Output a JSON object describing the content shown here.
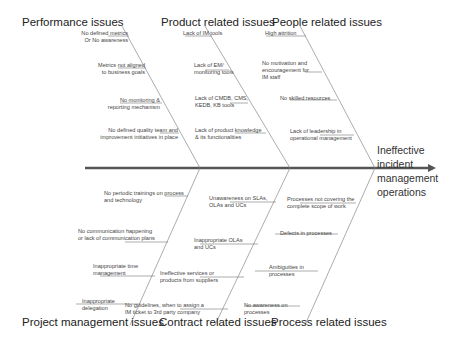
{
  "diagram": {
    "type": "fishbone",
    "effect": "Ineffective incident management operations",
    "effect_lines": [
      "Ineffective",
      "incident",
      "management",
      "operations"
    ],
    "categories": {
      "performance": {
        "title": "Performance issues",
        "causes": [
          "No defined metrics Or No awareness",
          "Metrics not aligned to business goals",
          "No monitoring & reporting mechanism",
          "No defined quality team and improvement initiatives in place"
        ]
      },
      "product": {
        "title": "Product related issues",
        "causes": [
          "Lack of IM tools",
          "Lack of EM/ monitoring tools",
          "Lack of CMDB, CMS, KEDB, KB tools",
          "Lack of product knowledge & its functionalities"
        ]
      },
      "people": {
        "title": "People related issues",
        "causes": [
          "High attrition",
          "No motivation and encouragement for IM staff",
          "No skilled resources",
          "Lack of leadership in operational management"
        ]
      },
      "project": {
        "title": "Project management issues",
        "causes": [
          "No periodic trainings on process and technology",
          "No communication happening or lack of communication plans",
          "Inappropriate time management",
          "Inappropriate delegation"
        ]
      },
      "contract": {
        "title": "Contract related issues",
        "causes": [
          "Unawareness on SLAs, OLAs and UCs",
          "Inappropriate OLAs and UCs",
          "Ineffective services or products from suppliers",
          "No guidelines, when to assign a IM ticket to 3rd party company"
        ]
      },
      "process": {
        "title": "Process related issues",
        "causes": [
          "Processes not covering the complete scope of work",
          "Defects in processes",
          "Ambiguities in processes",
          "No awareness on processes"
        ]
      }
    },
    "text": {
      "perf_c1_a": "No defined metrics",
      "perf_c1_b": "Or  No awareness",
      "perf_c2_a": "Metrics not aligned",
      "perf_c2_b": "to business goals",
      "perf_c3_a": "No monitoring &",
      "perf_c3_b": "reporting mechanism",
      "perf_c4_a": "No defined quality team and",
      "perf_c4_b": "improvement initiatives in place",
      "prod_c1_a": "Lack of IM tools",
      "prod_c2_a": "Lack of EM/",
      "prod_c2_b": "monitoring tools",
      "prod_c3_a": "Lack of CMDB, CMS,",
      "prod_c3_b": "KEDB, KB tools",
      "prod_c4_a": "Lack of product knowledge",
      "prod_c4_b": "& its functionalities",
      "peop_c1_a": "High attrition",
      "peop_c2_a": "No motivation and",
      "peop_c2_b": "encouragement for",
      "peop_c2_c": "IM staff",
      "peop_c3_a": "No skilled resources",
      "peop_c4_a": "Lack of leadership in",
      "peop_c4_b": "operational management",
      "proj_c1_a": "No periodic trainings on process",
      "proj_c1_b": "and technology",
      "proj_c2_a": "No communication happening",
      "proj_c2_b": "or lack of communication plans",
      "proj_c3_a": "Inappropriate time",
      "proj_c3_b": "management",
      "proj_c4_a": "Inappropriate",
      "proj_c4_b": "delegation",
      "cont_c1_a": "Unawareness on SLAs,",
      "cont_c1_b": "OLAs and UCs",
      "cont_c2_a": "Inappropriate OLAs",
      "cont_c2_b": "and UCs",
      "cont_c3_a": "Ineffective services or",
      "cont_c3_b": "products from suppliers",
      "cont_c4_a": "No guidelines, when to assign a",
      "cont_c4_b": "IM ticket to 3rd party company",
      "proc_c1_a": "Processes not covering the",
      "proc_c1_b": "complete scope of work",
      "proc_c2_a": "Defects in processes",
      "proc_c3_a": "Ambiguities in",
      "proc_c3_b": "processes",
      "proc_c4_a": "No awareness on",
      "proc_c4_b": "processes"
    }
  },
  "colors": {
    "spine": "#555555",
    "bones": "#888888",
    "text": "#333333",
    "background": "#ffffff"
  }
}
